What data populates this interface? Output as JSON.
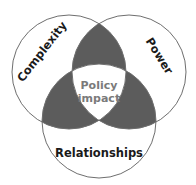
{
  "diagram": {
    "type": "venn",
    "colors": {
      "background": "#ffffff",
      "outline": "#6e6e6e",
      "pairwise_overlap": "#5c5c5c",
      "label_text": "#1a1a1a",
      "center_text": "#7a7a7a"
    },
    "circles": [
      {
        "id": "complexity",
        "label": "Complexity"
      },
      {
        "id": "power",
        "label": "Power"
      },
      {
        "id": "relationships",
        "label": "Relationships"
      }
    ],
    "center": {
      "line1": "Policy",
      "line2": "impact"
    }
  }
}
